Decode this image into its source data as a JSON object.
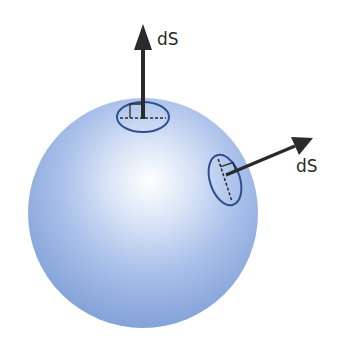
{
  "diagram": {
    "labels": {
      "top_vector": "dS",
      "side_vector": "dS"
    },
    "colors": {
      "sphere_edge": "#7f9fd6",
      "sphere_highlight": "#ffffff",
      "patch_outline": "#2f4f8f",
      "arrow": "#2a2a2a",
      "background": "#ffffff"
    }
  }
}
